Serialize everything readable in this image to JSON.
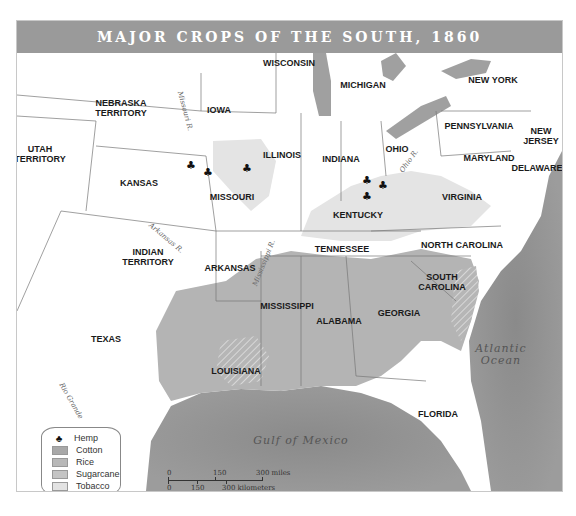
{
  "title": "MAJOR CROPS OF THE SOUTH, 1860",
  "states": [
    {
      "name": "WISCONSIN",
      "x": 288,
      "y": 62
    },
    {
      "name": "MICHIGAN",
      "x": 362,
      "y": 84
    },
    {
      "name": "NEW YORK",
      "x": 492,
      "y": 79
    },
    {
      "name": "NEBRASKA\nTERRITORY",
      "x": 120,
      "y": 107
    },
    {
      "name": "IOWA",
      "x": 218,
      "y": 109
    },
    {
      "name": "PENNSYLVANIA",
      "x": 478,
      "y": 125
    },
    {
      "name": "NEW\nJERSEY",
      "x": 540,
      "y": 135
    },
    {
      "name": "UTAH\nTERRITORY",
      "x": 39,
      "y": 153
    },
    {
      "name": "ILLINOIS",
      "x": 281,
      "y": 154
    },
    {
      "name": "INDIANA",
      "x": 340,
      "y": 158
    },
    {
      "name": "OHIO",
      "x": 396,
      "y": 148
    },
    {
      "name": "MARYLAND",
      "x": 488,
      "y": 157
    },
    {
      "name": "DELAWARE",
      "x": 536,
      "y": 167
    },
    {
      "name": "KANSAS",
      "x": 138,
      "y": 182
    },
    {
      "name": "MISSOURI",
      "x": 231,
      "y": 196
    },
    {
      "name": "KENTUCKY",
      "x": 357,
      "y": 214
    },
    {
      "name": "VIRGINIA",
      "x": 461,
      "y": 196
    },
    {
      "name": "TENNESSEE",
      "x": 341,
      "y": 248
    },
    {
      "name": "NORTH CAROLINA",
      "x": 461,
      "y": 244
    },
    {
      "name": "INDIAN\nTERRITORY",
      "x": 147,
      "y": 256
    },
    {
      "name": "ARKANSAS",
      "x": 229,
      "y": 267
    },
    {
      "name": "SOUTH\nCAROLINA",
      "x": 441,
      "y": 281
    },
    {
      "name": "MISSISSIPPI",
      "x": 286,
      "y": 305
    },
    {
      "name": "ALABAMA",
      "x": 338,
      "y": 320
    },
    {
      "name": "GEORGIA",
      "x": 398,
      "y": 312
    },
    {
      "name": "TEXAS",
      "x": 105,
      "y": 338
    },
    {
      "name": "LOUISIANA",
      "x": 235,
      "y": 370
    },
    {
      "name": "FLORIDA",
      "x": 437,
      "y": 413
    }
  ],
  "rivers": [
    {
      "name": "Missouri R.",
      "x": 184,
      "y": 110,
      "rotate": 75
    },
    {
      "name": "Ohio R.",
      "x": 408,
      "y": 160,
      "rotate": -55
    },
    {
      "name": "Arkansas R.",
      "x": 165,
      "y": 237,
      "rotate": 40
    },
    {
      "name": "Mississippi R.",
      "x": 263,
      "y": 262,
      "rotate": -68
    },
    {
      "name": "Rio Grande",
      "x": 70,
      "y": 400,
      "rotate": 60
    }
  ],
  "water": [
    {
      "name": "Atlantic\nOcean",
      "x": 500,
      "y": 354
    },
    {
      "name": "Gulf of Mexico",
      "x": 300,
      "y": 440
    }
  ],
  "legend": {
    "items": [
      {
        "label": "Hemp",
        "type": "icon"
      },
      {
        "label": "Cotton",
        "color": "#a8a8a8"
      },
      {
        "label": "Rice",
        "color": "#b8b8b8"
      },
      {
        "label": "Sugarcane",
        "color": "#c4c4c4"
      },
      {
        "label": "Tobacco",
        "color": "#e2e2e2"
      }
    ]
  },
  "scale": {
    "miles": [
      "0",
      "150",
      "300 miles"
    ],
    "km": [
      "0",
      "150",
      "300 kilometers"
    ]
  },
  "colors": {
    "title_bar": "#9a9a9a",
    "water": "#8f8f8f",
    "lakes": "#a0a0a0",
    "cotton": "#b0b0b0",
    "tobacco": "#e4e4e4",
    "land": "#ffffff"
  },
  "hemp_markers": [
    {
      "x": 190,
      "y": 165
    },
    {
      "x": 207,
      "y": 172
    },
    {
      "x": 246,
      "y": 168
    },
    {
      "x": 366,
      "y": 180
    },
    {
      "x": 382,
      "y": 185
    },
    {
      "x": 366,
      "y": 196
    }
  ]
}
